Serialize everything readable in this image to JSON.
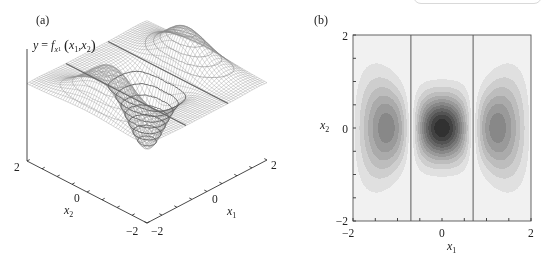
{
  "figure": {
    "panel_a": {
      "label": "(a)"
    },
    "panel_b": {
      "label": "(b)"
    }
  },
  "chart_data": [
    {
      "panel": "(a)",
      "type": "heatmap",
      "render": "3d-wireframe-surface",
      "title": "",
      "zlabel": {
        "full_text": "y = f_{x1}(x1, x2)",
        "y": "y",
        "eq": "=",
        "f": "f",
        "f_sub": "x",
        "f_sub_index": "1",
        "open": "(",
        "arg1": "x",
        "arg1_index": "1",
        "comma": ",",
        "arg2": "x",
        "arg2_index": "2",
        "close": ")"
      },
      "xlabel": {
        "base": "x",
        "sub": "1"
      },
      "ylabel": {
        "base": "x",
        "sub": "2"
      },
      "x_tick_labels": {
        "min": "−2",
        "mid": "0",
        "max": "2"
      },
      "y_tick_labels": {
        "max": "2",
        "mid": "0",
        "min": "−2"
      },
      "xlim": [
        -2,
        2
      ],
      "ylim": [
        -2,
        2
      ],
      "minor_tick_step": 0.5,
      "grid": false,
      "zero_lines_x1": [
        -0.7,
        0.7
      ],
      "features": {
        "global_minimum": {
          "x1": 0,
          "x2": 0,
          "value": -1.0
        },
        "side_maxima": [
          {
            "x1": -1.22,
            "x2": 0,
            "value": 0.56
          },
          {
            "x1": 1.22,
            "x2": 0,
            "value": 0.56
          }
        ]
      },
      "model": {
        "period": 1.4,
        "x1_decay": 3,
        "x2_width": 0.44,
        "x2_width_growth": 1.44,
        "sign": -1
      },
      "mesh_lines": 50,
      "mesh_color": "#8f8f8f",
      "rings": [
        {
          "center": [
            0,
            0
          ],
          "levels": [
            0.12,
            0.25,
            0.38,
            0.5,
            0.62,
            0.75,
            0.88
          ],
          "stroke": "#5c5c5c",
          "width": 0.9
        },
        {
          "center": [
            1.22,
            0
          ],
          "levels": [
            0.1,
            0.2,
            0.3,
            0.4,
            0.5
          ],
          "stroke": "#8a8a8a",
          "width": 0.6
        },
        {
          "center": [
            -1.22,
            0
          ],
          "levels": [
            0.1,
            0.2,
            0.3,
            0.4,
            0.5
          ],
          "stroke": "#9a9a9a",
          "width": 0.5
        }
      ],
      "grid_x1": [
        -2,
        -1.5,
        -1,
        -0.5,
        0,
        0.5,
        1,
        1.5,
        2
      ],
      "grid_x2": [
        2,
        1.5,
        1,
        0.5,
        0,
        -0.5,
        -1,
        -1.5,
        -2
      ],
      "z": [
        [
          0.01,
          0.01,
          0.0,
          0.0,
          0.0,
          0.0,
          0.0,
          0.01,
          0.01
        ],
        [
          0.02,
          0.06,
          0.02,
          -0.01,
          -0.01,
          -0.01,
          0.02,
          0.06,
          0.02
        ],
        [
          0.03,
          0.19,
          0.12,
          -0.06,
          -0.1,
          -0.06,
          0.12,
          0.19,
          0.03
        ],
        [
          0.05,
          0.37,
          0.32,
          -0.25,
          -0.57,
          -0.25,
          0.32,
          0.37,
          0.05
        ],
        [
          0.06,
          0.46,
          0.45,
          -0.4,
          -1.0,
          -0.4,
          0.45,
          0.46,
          0.06
        ],
        [
          0.05,
          0.37,
          0.32,
          -0.25,
          -0.57,
          -0.25,
          0.32,
          0.37,
          0.05
        ],
        [
          0.03,
          0.19,
          0.12,
          -0.06,
          -0.1,
          -0.06,
          0.12,
          0.19,
          0.03
        ],
        [
          0.02,
          0.06,
          0.02,
          -0.01,
          -0.01,
          -0.01,
          0.02,
          0.06,
          0.02
        ],
        [
          0.01,
          0.01,
          0.0,
          0.0,
          0.0,
          0.0,
          0.0,
          0.01,
          0.01
        ]
      ]
    },
    {
      "panel": "(b)",
      "type": "heatmap",
      "render": "filled-contour",
      "title": "",
      "xlabel": {
        "base": "x",
        "sub": "1"
      },
      "ylabel": {
        "base": "x",
        "sub": "2"
      },
      "x_tick_labels": {
        "min": "−2",
        "mid": "0",
        "max": "2"
      },
      "y_tick_labels": {
        "max": "2",
        "mid": "0",
        "min": "−2"
      },
      "xlim": [
        -2,
        2
      ],
      "ylim": [
        -2,
        2
      ],
      "minor_tick_step": 0.5,
      "grid": false,
      "legend": "none",
      "zero_lines_x1": [
        -0.7,
        0.7
      ],
      "contour_of": "|y|",
      "levels": 12,
      "colors": {
        "background": "#f1f1f1",
        "darkest": "#1f1f1f",
        "frame": "#555555",
        "zero_line": "#5a5a5a"
      },
      "blobs": [
        {
          "x1": -1.22,
          "x2": 0,
          "extent_x2": [
            -1.3,
            1.3
          ],
          "shade": "medium"
        },
        {
          "x1": 0,
          "x2": 0,
          "extent_x2": [
            -1.05,
            1.05
          ],
          "shade": "dark"
        },
        {
          "x1": 1.22,
          "x2": 0,
          "extent_x2": [
            -1.3,
            1.3
          ],
          "shade": "medium"
        }
      ],
      "model": {
        "period": 1.4,
        "x1_decay": 3,
        "x2_width": 0.44,
        "x2_width_growth": 1.44,
        "sign": -1
      }
    }
  ]
}
